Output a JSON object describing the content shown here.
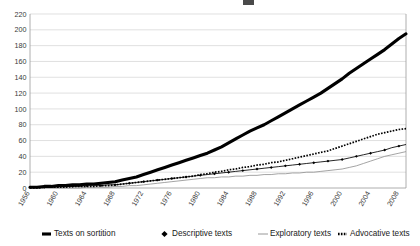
{
  "chart_data": {
    "type": "line",
    "title": "",
    "subtitle": "",
    "xlabel": "",
    "ylabel": "",
    "ylim": [
      0,
      220
    ],
    "ytick_step": 20,
    "yticks": [
      0,
      20,
      40,
      60,
      80,
      100,
      120,
      140,
      160,
      180,
      200,
      220
    ],
    "grid": true,
    "legend_position": "bottom",
    "xlim": [
      1956,
      2009
    ],
    "x_tick_labels": [
      "1956",
      "1960",
      "1964",
      "1968",
      "1972",
      "1976",
      "1980",
      "1984",
      "1988",
      "1992",
      "1996",
      "2000",
      "2004",
      "2008"
    ],
    "x_tick_values": [
      1956,
      1960,
      1964,
      1968,
      1972,
      1976,
      1980,
      1984,
      1988,
      1992,
      1996,
      2000,
      2004,
      2008
    ],
    "x": [
      1956,
      1957,
      1958,
      1959,
      1960,
      1961,
      1962,
      1963,
      1964,
      1965,
      1966,
      1967,
      1968,
      1969,
      1970,
      1971,
      1972,
      1973,
      1974,
      1975,
      1976,
      1977,
      1978,
      1979,
      1980,
      1981,
      1982,
      1983,
      1984,
      1985,
      1986,
      1987,
      1988,
      1989,
      1990,
      1991,
      1992,
      1993,
      1994,
      1995,
      1996,
      1997,
      1998,
      1999,
      2000,
      2001,
      2002,
      2003,
      2004,
      2005,
      2006,
      2007,
      2008,
      2009
    ],
    "series": [
      {
        "name": "Texts on sortition",
        "marker": "none",
        "line": "thick-solid",
        "color": "#000000",
        "values": [
          1,
          1,
          2,
          2,
          3,
          3,
          4,
          4,
          5,
          5,
          6,
          7,
          8,
          10,
          12,
          14,
          17,
          20,
          23,
          26,
          29,
          32,
          35,
          38,
          41,
          44,
          48,
          52,
          57,
          62,
          67,
          72,
          76,
          80,
          85,
          90,
          95,
          100,
          105,
          110,
          115,
          120,
          126,
          132,
          138,
          145,
          151,
          157,
          163,
          169,
          175,
          182,
          189,
          195
        ]
      },
      {
        "name": "Descriptive texts",
        "marker": "diamond",
        "line": "thin-solid",
        "color": "#000000",
        "values": [
          1,
          1,
          1,
          1,
          2,
          2,
          2,
          2,
          3,
          3,
          3,
          4,
          4,
          5,
          6,
          7,
          8,
          9,
          10,
          11,
          12,
          13,
          14,
          15,
          16,
          17,
          18,
          19,
          20,
          21,
          22,
          23,
          24,
          25,
          26,
          27,
          28,
          29,
          30,
          31,
          32,
          33,
          34,
          35,
          36,
          38,
          40,
          42,
          44,
          46,
          48,
          51,
          53,
          55
        ]
      },
      {
        "name": "Exploratory texts",
        "marker": "none",
        "line": "thin-grey",
        "color": "#8d8d8d",
        "values": [
          0,
          0,
          0,
          0,
          0,
          0,
          0,
          0,
          1,
          1,
          1,
          1,
          2,
          2,
          3,
          3,
          4,
          5,
          6,
          7,
          8,
          9,
          10,
          11,
          12,
          13,
          13,
          14,
          14,
          15,
          15,
          16,
          16,
          17,
          17,
          18,
          18,
          19,
          19,
          20,
          20,
          21,
          22,
          23,
          24,
          26,
          28,
          31,
          34,
          37,
          40,
          42,
          44,
          46
        ]
      },
      {
        "name": "Advocative texts",
        "marker": "none",
        "line": "dotted-thick",
        "color": "#000000",
        "values": [
          0,
          0,
          1,
          1,
          1,
          1,
          2,
          2,
          2,
          2,
          3,
          3,
          4,
          5,
          6,
          7,
          8,
          9,
          10,
          11,
          12,
          13,
          14,
          15,
          17,
          18,
          20,
          21,
          23,
          24,
          26,
          27,
          29,
          30,
          32,
          33,
          35,
          37,
          39,
          41,
          43,
          45,
          47,
          50,
          53,
          56,
          59,
          62,
          65,
          68,
          70,
          72,
          74,
          75
        ]
      }
    ]
  },
  "legend": {
    "items": [
      {
        "label": "Texts on sortition",
        "swatch": "thick-line-swatch"
      },
      {
        "label": "Descriptive texts",
        "swatch": "diamond-marker-swatch"
      },
      {
        "label": "Exploratory texts",
        "swatch": "thin-line-swatch"
      },
      {
        "label": "Advocative texts",
        "swatch": "dotted-line-swatch"
      }
    ]
  },
  "colors": {
    "background": "#ffffff",
    "grid": "#d2d2d2",
    "axis": "#9a9a9a",
    "ink": "#000000",
    "grey_series": "#8d8d8d",
    "tick_text": "#3a3a3a"
  }
}
